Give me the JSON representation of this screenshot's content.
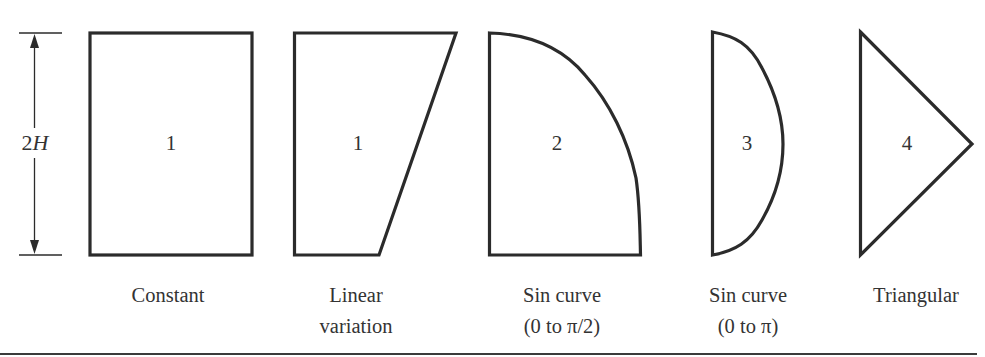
{
  "figure": {
    "dimension_label": {
      "prefix": "2",
      "variable": "H"
    },
    "shapes": [
      {
        "type": "constant",
        "number": "1",
        "caption_lines": [
          "Constant"
        ]
      },
      {
        "type": "linear-variation",
        "number": "1",
        "caption_lines": [
          "Linear",
          "variation"
        ]
      },
      {
        "type": "sin-curve-half-pi",
        "number": "2",
        "caption_lines": [
          "Sin curve",
          "(0 to π/2)"
        ]
      },
      {
        "type": "sin-curve-pi",
        "number": "3",
        "caption_lines": [
          "Sin curve",
          "(0 to π)"
        ]
      },
      {
        "type": "triangular",
        "number": "4",
        "caption_lines": [
          "Triangular"
        ]
      }
    ],
    "colors": {
      "stroke": "#2b2b2b",
      "text": "#333333",
      "background": "#ffffff"
    }
  }
}
